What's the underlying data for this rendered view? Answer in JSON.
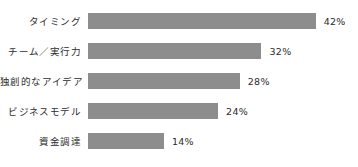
{
  "chart_data": {
    "type": "bar",
    "orientation": "horizontal",
    "title": "",
    "xlabel": "",
    "ylabel": "",
    "grid": false,
    "legend": false,
    "xlim": [
      0,
      42
    ],
    "categories": [
      "タイミング",
      "チーム／実行力",
      "独創的なアイデア",
      "ビジネスモデル",
      "資金調達"
    ],
    "values": [
      42,
      32,
      28,
      24,
      14
    ],
    "value_labels": [
      "42%",
      "32%",
      "28%",
      "24%",
      "14%"
    ],
    "bar_color": "#8d8d8d",
    "text_color": "#2b2b2b",
    "background_color": "#ffffff"
  },
  "rows": [
    {
      "label": "タイミング",
      "value": 42,
      "value_label": "42%"
    },
    {
      "label": "チーム／実行力",
      "value": 32,
      "value_label": "32%"
    },
    {
      "label": "独創的なアイデア",
      "value": 28,
      "value_label": "28%"
    },
    {
      "label": "ビジネスモデル",
      "value": 24,
      "value_label": "24%"
    },
    {
      "label": "資金調達",
      "value": 14,
      "value_label": "14%"
    }
  ]
}
